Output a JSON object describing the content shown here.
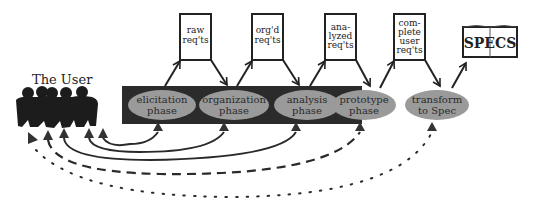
{
  "diagram": {
    "user": {
      "label": "The User"
    },
    "phases": [
      {
        "id": "elicitation",
        "line1": "elicitation",
        "line2": "phase",
        "in_dark_block": true
      },
      {
        "id": "organization",
        "line1": "organization",
        "line2": "phase",
        "in_dark_block": true
      },
      {
        "id": "analysis",
        "line1": "analysis",
        "line2": "phase",
        "in_dark_block": true
      },
      {
        "id": "prototype",
        "line1": "prototype",
        "line2": "phase",
        "in_dark_block": false
      },
      {
        "id": "transform",
        "line1": "transform",
        "line2": "to  Spec",
        "in_dark_block": false
      }
    ],
    "artifacts": [
      {
        "id": "raw",
        "lines": [
          "raw",
          "req'ts"
        ]
      },
      {
        "id": "orgd",
        "lines": [
          "org'd",
          "req'ts"
        ]
      },
      {
        "id": "analyzed",
        "lines": [
          "ana-",
          "lyzed",
          "req'ts"
        ]
      },
      {
        "id": "complete",
        "lines": [
          "com-",
          "plete",
          "user",
          "req'ts"
        ]
      }
    ],
    "output": {
      "label": "SPECS",
      "icon": "open-book-icon"
    },
    "feedback_links": [
      {
        "from": "elicitation",
        "to": "user",
        "style": "solid"
      },
      {
        "from": "organization",
        "to": "user",
        "style": "solid"
      },
      {
        "from": "analysis",
        "to": "user",
        "style": "solid"
      },
      {
        "from": "prototype",
        "to": "user",
        "style": "dashed"
      },
      {
        "from": "transform",
        "to": "user",
        "style": "dotted"
      }
    ],
    "colors": {
      "dark_block": "#2b2b2b",
      "ellipse_fill": "#9a9a9a",
      "line": "#222222",
      "background": "#ffffff"
    }
  }
}
